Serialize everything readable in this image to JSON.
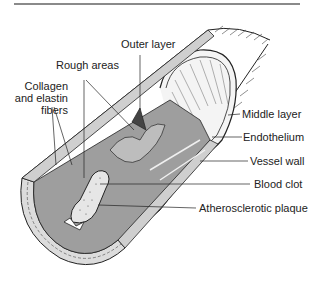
{
  "diagram": {
    "labels": {
      "outer_layer": "Outer layer",
      "rough_areas": "Rough areas",
      "collagen_line1": "Collagen",
      "collagen_line2": "and elastin",
      "collagen_line3": "fibers",
      "middle_layer": "Middle layer",
      "endothelium": "Endothelium",
      "vessel_wall": "Vessel wall",
      "blood_clot": "Blood clot",
      "atherosclerotic_plaque": "Atherosclerotic plaque"
    },
    "colors": {
      "line": "#222222",
      "lumen_shade": "#9a9a9a",
      "wall_fill": "#d8d8d8",
      "clot_fill": "#e8e8e8",
      "rule": "#8a8a8a"
    }
  }
}
